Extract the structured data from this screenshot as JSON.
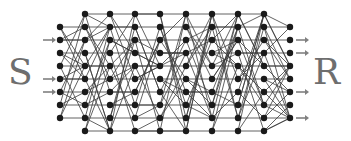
{
  "labels": {
    "source": "S",
    "sink": "R"
  },
  "colors": {
    "node": "#1a1a1a",
    "edge": "#3a3a3a",
    "arrow": "#808080",
    "label": "#6e6e6e"
  },
  "network": {
    "columns_x": [
      60,
      85,
      110,
      135,
      160,
      186,
      212,
      238,
      264,
      290
    ],
    "outer_rows_y": [
      27,
      40,
      53,
      66,
      79,
      92,
      105,
      118
    ],
    "inner_rows_y": [
      14,
      27,
      40,
      53,
      66,
      79,
      92,
      105,
      118,
      131
    ],
    "input_arrow_rows_y": [
      40,
      79,
      92
    ],
    "output_arrow_rows_y": [
      40,
      53,
      92,
      118
    ]
  }
}
